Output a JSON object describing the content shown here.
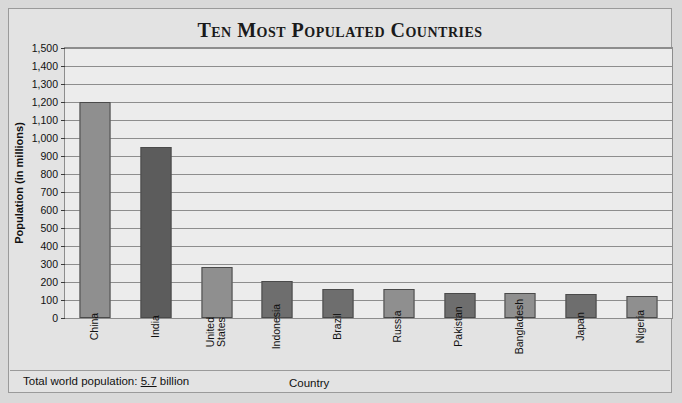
{
  "chart_data": {
    "type": "bar",
    "title": "Ten Most Populated Countries",
    "xlabel": "Country",
    "ylabel": "Population (in millions)",
    "ylim": [
      0,
      1500
    ],
    "ytick_step": 100,
    "grid": true,
    "legend": "none",
    "categories": [
      "China",
      "India",
      "United\nStates",
      "Indonesia",
      "Brazil",
      "Russia",
      "Pakistan",
      "Bangladesh",
      "Japan",
      "Nigeria"
    ],
    "values": [
      1200,
      950,
      285,
      205,
      160,
      160,
      140,
      140,
      135,
      120
    ],
    "ytick_labels": [
      "1,500",
      "1,400",
      "1,300",
      "1,200",
      "1,100",
      "1,000",
      "900",
      "800",
      "700",
      "600",
      "500",
      "400",
      "300",
      "200",
      "100",
      "0"
    ],
    "bar_colors": [
      "#8f8f8f",
      "#5c5c5c",
      "#8f8f8f",
      "#6e6e6e",
      "#6e6e6e",
      "#8f8f8f",
      "#6e6e6e",
      "#8f8f8f",
      "#6e6e6e",
      "#8f8f8f"
    ]
  },
  "footnote": {
    "prefix": "Total world population: ",
    "value": "5.7",
    "suffix": " billion"
  },
  "colors": {
    "page_background": "#d9d9d9",
    "figure_background": "#e3e3e3",
    "plot_background": "#ececec",
    "gridline": "#8d8d8d",
    "text": "#111111",
    "bar_light": "#8f8f8f",
    "bar_dark": "#5c5c5c",
    "bar_mid": "#6e6e6e"
  }
}
